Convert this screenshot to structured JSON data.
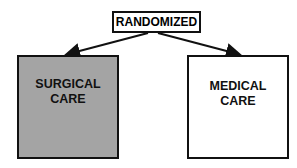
{
  "diagram": {
    "root": {
      "label": "RANDOMIZED"
    },
    "branches": [
      {
        "line1": "SURGICAL",
        "line2": "CARE",
        "fill": "#a4a4a4"
      },
      {
        "line1": "MEDICAL",
        "line2": "CARE",
        "fill": "#ffffff"
      }
    ]
  }
}
